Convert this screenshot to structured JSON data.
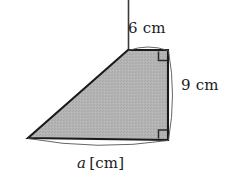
{
  "figure": {
    "canvas": {
      "width": 238,
      "height": 184,
      "background_color": "#ffffff"
    },
    "shape": {
      "name": "right-trapezoid",
      "fill_color": "#b3b3b3",
      "stroke_color": "#1a1a1a",
      "vertices": [
        {
          "label": "apex-top-left",
          "x": 128,
          "y": 50
        },
        {
          "label": "top-right",
          "x": 168,
          "y": 50
        },
        {
          "label": "bottom-right",
          "x": 168,
          "y": 140
        },
        {
          "label": "bottom-left",
          "x": 28,
          "y": 138
        }
      ]
    },
    "right_angles": [
      {
        "at": "top-right",
        "x": 168,
        "y": 50
      },
      {
        "at": "bottom-right",
        "x": 168,
        "y": 140
      }
    ],
    "extension_line": {
      "name": "vertical-extension",
      "from": {
        "x": 128,
        "y": 0
      },
      "to": {
        "x": 128,
        "y": 50
      }
    },
    "labels": {
      "top": "6 cm",
      "right": "9 cm",
      "bottom_variable": "a",
      "bottom_unit": "[cm]"
    }
  }
}
